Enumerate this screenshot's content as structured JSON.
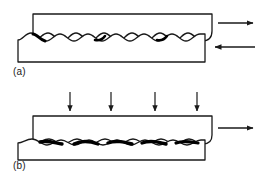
{
  "figure": {
    "background_color": "#ffffff",
    "line_color": "#1a1a1a",
    "asperity_contact_color": "#000000",
    "width": 270,
    "height": 186
  },
  "panels": [
    {
      "id": "a",
      "label": "(a)",
      "caption": "Two rough surfaces in sliding contact with small real area of contact",
      "upper_block": {
        "name": "upper-body",
        "x": 33,
        "y": 14,
        "width": 179,
        "height": 26,
        "fill": "#ffffff",
        "stroke": "#1a1a1a"
      },
      "lower_block": {
        "name": "lower-body",
        "x": 18,
        "y": 36,
        "width": 187,
        "height": 26,
        "fill": "#ffffff",
        "stroke": "#1a1a1a"
      },
      "interface": {
        "name": "wavy-interface",
        "wave_count": 6,
        "amplitude_px": 5,
        "contact_points": 4,
        "description": "interlocking wavy asperity profiles"
      },
      "arrows": [
        {
          "name": "shear-arrow-upper-right",
          "direction": "right",
          "x1": 218,
          "y1": 23,
          "x2": 255,
          "y2": 23,
          "label": ""
        },
        {
          "name": "shear-arrow-lower-left",
          "direction": "left",
          "x1": 255,
          "y1": 47,
          "x2": 213,
          "y2": 47,
          "label": ""
        }
      ]
    },
    {
      "id": "b",
      "label": "(b)",
      "caption": "Normal load applied: real area of contact increases",
      "upper_block": {
        "name": "upper-body",
        "x": 33,
        "y": 116,
        "width": 179,
        "height": 26,
        "fill": "#ffffff",
        "stroke": "#1a1a1a"
      },
      "lower_block": {
        "name": "lower-body",
        "x": 18,
        "y": 138,
        "width": 187,
        "height": 22,
        "fill": "#ffffff",
        "stroke": "#1a1a1a"
      },
      "interface": {
        "name": "wavy-interface",
        "wave_count": 6,
        "amplitude_px": 3,
        "contact_points": 5,
        "description": "flattened asperities with enlarged contact patches"
      },
      "arrows": [
        {
          "name": "normal-load-arrow-1",
          "direction": "down",
          "x1": 70,
          "y1": 92,
          "x2": 70,
          "y2": 113,
          "label": ""
        },
        {
          "name": "normal-load-arrow-2",
          "direction": "down",
          "x1": 111,
          "y1": 92,
          "x2": 111,
          "y2": 113,
          "label": ""
        },
        {
          "name": "normal-load-arrow-3",
          "direction": "down",
          "x1": 155,
          "y1": 92,
          "x2": 155,
          "y2": 113,
          "label": ""
        },
        {
          "name": "normal-load-arrow-4",
          "direction": "down",
          "x1": 197,
          "y1": 92,
          "x2": 197,
          "y2": 113,
          "label": ""
        },
        {
          "name": "shear-arrow-right",
          "direction": "right",
          "x1": 218,
          "y1": 128,
          "x2": 255,
          "y2": 128,
          "label": ""
        }
      ]
    }
  ]
}
